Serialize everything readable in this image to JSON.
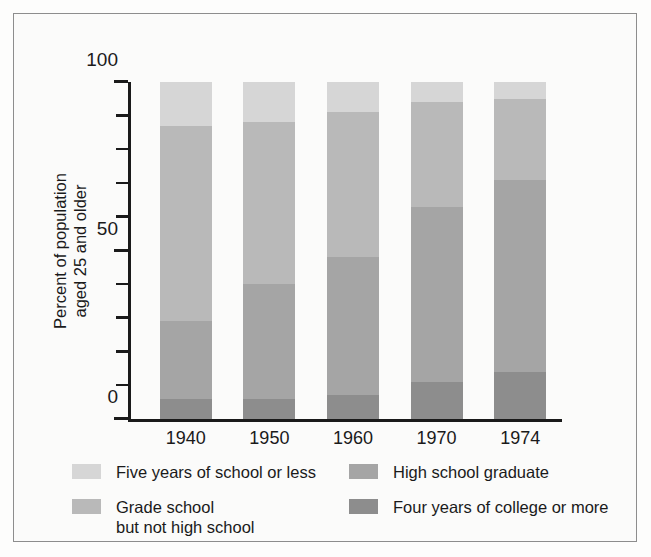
{
  "chart_data": {
    "type": "bar",
    "subtype": "stacked-100-percent-vertical",
    "title": "",
    "xlabel": "",
    "ylabel": "Percent of population aged 25 and older",
    "ylabel_line1": "Percent of population",
    "ylabel_line2": "aged 25 and older",
    "categories": [
      "1940",
      "1950",
      "1960",
      "1970",
      "1974"
    ],
    "ylim": [
      0,
      100
    ],
    "yticks": [
      0,
      10,
      20,
      30,
      40,
      50,
      60,
      70,
      80,
      90,
      100
    ],
    "ytick_labels_shown": [
      "0",
      "50",
      "100"
    ],
    "grid": false,
    "legend_position": "below-plot-two-columns",
    "stack_order_bottom_to_top": [
      "Four years of college or more",
      "High school graduate",
      "Grade school but not high school",
      "Five years of school or less"
    ],
    "series": [
      {
        "name": "Four years of college or more",
        "color": "#8d8d8d",
        "values": [
          6,
          6,
          7,
          11,
          14
        ]
      },
      {
        "name": "High school graduate",
        "color": "#a5a5a5",
        "values": [
          23,
          34,
          41,
          52,
          57
        ]
      },
      {
        "name": "Grade school but not high school",
        "color": "#b9b9b9",
        "values": [
          58,
          48,
          43,
          31,
          24
        ]
      },
      {
        "name": "Five years of school or less",
        "color": "#d6d6d6",
        "values": [
          13,
          12,
          9,
          6,
          5
        ]
      }
    ],
    "cumulative_tops": {
      "1940": [
        6,
        29,
        87,
        100
      ],
      "1950": [
        6,
        40,
        88,
        100
      ],
      "1960": [
        7,
        48,
        91,
        100
      ],
      "1970": [
        11,
        63,
        94,
        100
      ],
      "1974": [
        14,
        71,
        95,
        100
      ]
    }
  },
  "axis": {
    "y_tick_labels": [
      {
        "value": 100,
        "label": "100"
      },
      {
        "value": 90,
        "label": ""
      },
      {
        "value": 80,
        "label": ""
      },
      {
        "value": 70,
        "label": ""
      },
      {
        "value": 60,
        "label": ""
      },
      {
        "value": 50,
        "label": "50"
      },
      {
        "value": 40,
        "label": ""
      },
      {
        "value": 30,
        "label": ""
      },
      {
        "value": 20,
        "label": ""
      },
      {
        "value": 10,
        "label": ""
      },
      {
        "value": 0,
        "label": "0"
      }
    ]
  },
  "legend": {
    "left_column": [
      {
        "label": "Five years of school or less",
        "color": "#d6d6d6"
      },
      {
        "label": "Grade school\nbut not high school",
        "color": "#b9b9b9"
      }
    ],
    "right_column": [
      {
        "label": "High school graduate",
        "color": "#a5a5a5"
      },
      {
        "label": "Four years of college or more",
        "color": "#8d8d8d"
      }
    ]
  },
  "colors": {
    "five_years_or_less": "#d6d6d6",
    "grade_school": "#b9b9b9",
    "high_school_graduate": "#a5a5a5",
    "four_years_college": "#8d8d8d",
    "axis": "#1a1a1a",
    "frame": "#8d8d8d",
    "background": "#fbfbfa"
  }
}
